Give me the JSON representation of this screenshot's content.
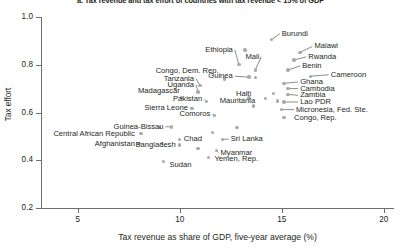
{
  "chart_data": {
    "type": "scatter",
    "title": "a. Tax revenue and tax effort of countries with tax revenue < 15% of GDP",
    "xlabel": "Tax revenue as share of GDP, five-year average (%)",
    "ylabel": "Tax effort",
    "xlim": [
      3.2,
      20.5
    ],
    "ylim": [
      0.2,
      1.0
    ],
    "xticks": [
      5,
      10,
      15,
      20
    ],
    "yticks": [
      0.2,
      0.4,
      0.6,
      0.8,
      1.0
    ],
    "xtick_labels": [
      "5",
      "10",
      "15",
      "20"
    ],
    "ytick_labels": [
      "0.2",
      "0.4",
      "0.6",
      "0.8",
      "1.0"
    ],
    "grid": false,
    "legend": "none",
    "marker_color": "#a7a9ac",
    "axis_color": "#6d6e71",
    "text_color": "#231f20",
    "points": [
      {
        "name": "Burundi",
        "x": 14.5,
        "y": 0.905,
        "lx": 15.0,
        "ly": 0.93,
        "align": "l",
        "leader": true
      },
      {
        "name": "Malawi",
        "x": 15.9,
        "y": 0.852,
        "lx": 16.6,
        "ly": 0.877,
        "align": "l",
        "leader": true
      },
      {
        "name": "Rwanda",
        "x": 15.6,
        "y": 0.82,
        "lx": 16.3,
        "ly": 0.833,
        "align": "l",
        "leader": true
      },
      {
        "name": "Ethiopia",
        "x": 12.9,
        "y": 0.8,
        "lx": 12.6,
        "ly": 0.862,
        "align": "r",
        "leader": true
      },
      {
        "name": "Mali",
        "x": 13.7,
        "y": 0.778,
        "lx": 13.9,
        "ly": 0.833,
        "align": "r",
        "leader": true
      },
      {
        "name": "Benin",
        "x": 15.3,
        "y": 0.778,
        "lx": 16.0,
        "ly": 0.795,
        "align": "l",
        "leader": true
      },
      {
        "name": "Cameroon",
        "x": 16.4,
        "y": 0.752,
        "lx": 17.4,
        "ly": 0.758,
        "align": "l",
        "leader": true
      },
      {
        "name": "Guinea",
        "x": 13.4,
        "y": 0.748,
        "lx": 12.6,
        "ly": 0.752,
        "align": "r",
        "leader": true
      },
      {
        "name": "Congo, Dem. Rep.",
        "x": 12.2,
        "y": 0.74,
        "lx": 11.9,
        "ly": 0.775,
        "align": "r",
        "leader": false
      },
      {
        "name": "Ghana",
        "x": 15.1,
        "y": 0.722,
        "lx": 15.9,
        "ly": 0.728,
        "align": "l",
        "leader": true
      },
      {
        "name": "Tanzania",
        "x": 11.0,
        "y": 0.712,
        "lx": 10.7,
        "ly": 0.742,
        "align": "r",
        "leader": true
      },
      {
        "name": "Cambodia",
        "x": 15.3,
        "y": 0.7,
        "lx": 15.9,
        "ly": 0.7,
        "align": "l",
        "leader": true
      },
      {
        "name": "Uganda",
        "x": 10.9,
        "y": 0.686,
        "lx": 10.7,
        "ly": 0.716,
        "align": "r",
        "leader": true
      },
      {
        "name": "Zambia",
        "x": 15.3,
        "y": 0.676,
        "lx": 15.9,
        "ly": 0.672,
        "align": "l",
        "leader": true
      },
      {
        "name": "Madagascar",
        "x": 10.1,
        "y": 0.664,
        "lx": 10.0,
        "ly": 0.688,
        "align": "r",
        "leader": false
      },
      {
        "name": "Haiti",
        "x": 13.4,
        "y": 0.66,
        "lx": 13.5,
        "ly": 0.678,
        "align": "r",
        "leader": false
      },
      {
        "name": "Pakistan",
        "x": 11.3,
        "y": 0.646,
        "lx": 11.1,
        "ly": 0.655,
        "align": "r",
        "leader": true
      },
      {
        "name": "Lao PDR",
        "x": 15.1,
        "y": 0.644,
        "lx": 15.9,
        "ly": 0.644,
        "align": "l",
        "leader": true
      },
      {
        "name": "Mauritania",
        "x": 13.6,
        "y": 0.628,
        "lx": 13.7,
        "ly": 0.648,
        "align": "r",
        "leader": false
      },
      {
        "name": "Sierra Leone",
        "x": 10.6,
        "y": 0.616,
        "lx": 10.4,
        "ly": 0.62,
        "align": "r",
        "leader": true
      },
      {
        "name": "Micronesia, Fed. Ste.",
        "x": 15.0,
        "y": 0.612,
        "lx": 15.7,
        "ly": 0.612,
        "align": "l",
        "leader": true
      },
      {
        "name": "Comoros",
        "x": 11.7,
        "y": 0.588,
        "lx": 11.5,
        "ly": 0.592,
        "align": "r",
        "leader": true
      },
      {
        "name": "Congo, Rep.",
        "x": 15.1,
        "y": 0.578,
        "lx": 15.6,
        "ly": 0.578,
        "align": "l",
        "leader": false
      },
      {
        "name": "Guinea-Bissau",
        "x": 9.6,
        "y": 0.54,
        "lx": 9.2,
        "ly": 0.54,
        "align": "r",
        "leader": true
      },
      {
        "name": "Central African Republic",
        "x": 8.1,
        "y": 0.512,
        "lx": 7.8,
        "ly": 0.512,
        "align": "r",
        "leader": false
      },
      {
        "name": "Chad",
        "x": 10.0,
        "y": 0.488,
        "lx": 10.2,
        "ly": 0.488,
        "align": "l",
        "leader": false
      },
      {
        "name": "Sri Lanka",
        "x": 12.1,
        "y": 0.488,
        "lx": 12.5,
        "ly": 0.488,
        "align": "l",
        "leader": true
      },
      {
        "name": "Afghanistan",
        "x": 8.0,
        "y": 0.47,
        "lx": 7.8,
        "ly": 0.47,
        "align": "r",
        "leader": true
      },
      {
        "name": "Bangladesh",
        "x": 10.0,
        "y": 0.464,
        "lx": 9.8,
        "ly": 0.464,
        "align": "r",
        "leader": false
      },
      {
        "name": "Myanmar",
        "x": 11.8,
        "y": 0.442,
        "lx": 12.0,
        "ly": 0.432,
        "align": "l",
        "leader": true
      },
      {
        "name": "Yemen, Rep.",
        "x": 11.4,
        "y": 0.412,
        "lx": 11.7,
        "ly": 0.404,
        "align": "l",
        "leader": false
      },
      {
        "name": "Sudan",
        "x": 9.2,
        "y": 0.394,
        "lx": 9.5,
        "ly": 0.382,
        "align": "l",
        "leader": false
      },
      {
        "name": "unlabeled-1",
        "x": 13.2,
        "y": 0.862,
        "lx": null,
        "ly": null,
        "align": "l",
        "leader": false
      },
      {
        "name": "unlabeled-2",
        "x": 13.7,
        "y": 0.746,
        "lx": null,
        "ly": null,
        "align": "l",
        "leader": false
      },
      {
        "name": "unlabeled-3",
        "x": 14.6,
        "y": 0.68,
        "lx": null,
        "ly": null,
        "align": "l",
        "leader": false
      },
      {
        "name": "unlabeled-4",
        "x": 14.2,
        "y": 0.658,
        "lx": null,
        "ly": null,
        "align": "l",
        "leader": false
      },
      {
        "name": "unlabeled-5",
        "x": 14.8,
        "y": 0.648,
        "lx": null,
        "ly": null,
        "align": "l",
        "leader": false
      },
      {
        "name": "unlabeled-6",
        "x": 12.8,
        "y": 0.536,
        "lx": null,
        "ly": null,
        "align": "l",
        "leader": false
      },
      {
        "name": "unlabeled-7",
        "x": 11.6,
        "y": 0.516,
        "lx": null,
        "ly": null,
        "align": "l",
        "leader": false
      },
      {
        "name": "unlabeled-8",
        "x": 9.1,
        "y": 0.47,
        "lx": null,
        "ly": null,
        "align": "l",
        "leader": false
      },
      {
        "name": "unlabeled-9",
        "x": 10.9,
        "y": 0.448,
        "lx": null,
        "ly": null,
        "align": "l",
        "leader": false
      },
      {
        "name": "unlabeled-10",
        "x": 9.0,
        "y": 0.538,
        "lx": null,
        "ly": null,
        "align": "l",
        "leader": false
      }
    ]
  }
}
